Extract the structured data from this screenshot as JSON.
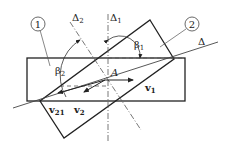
{
  "diagram": {
    "bodies": [
      {
        "id": "body-1",
        "label": "1"
      },
      {
        "id": "body-2",
        "label": "2"
      }
    ],
    "axes": {
      "delta": "Δ",
      "delta1": "Δ",
      "delta1_sub": "1",
      "delta2": "Δ",
      "delta2_sub": "2"
    },
    "angles": {
      "beta1": "β",
      "beta1_sub": "1",
      "beta2": "β",
      "beta2_sub": "2"
    },
    "point": "A",
    "vectors": {
      "v1": "v",
      "v1_sub": "1",
      "v2": "v",
      "v2_sub": "2",
      "v21": "v",
      "v21_sub": "21"
    },
    "colors": {
      "line": "#222222",
      "thin": "#555555"
    }
  }
}
